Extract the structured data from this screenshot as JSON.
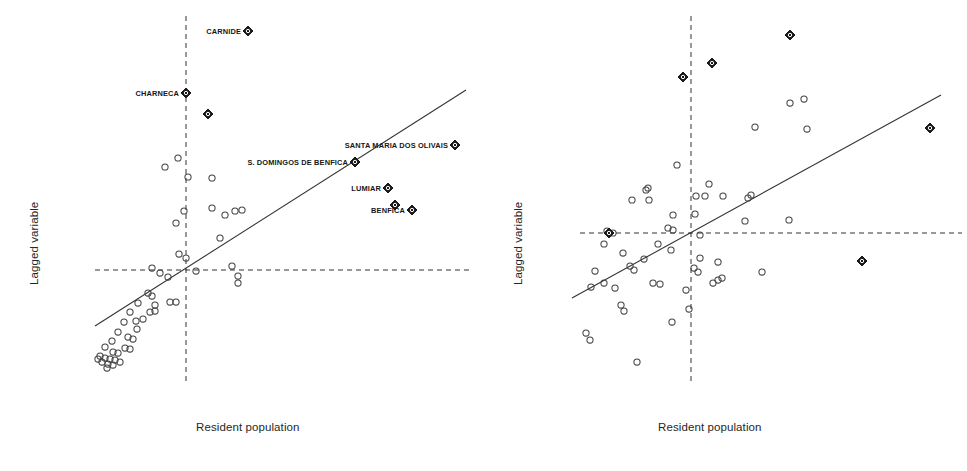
{
  "figure": {
    "background": "#ffffff",
    "ink": "#333333",
    "marker_open_color": "#444444",
    "marker_filled_color": "#1a1a1a"
  },
  "chart_data": [
    {
      "id": "left-panel",
      "type": "scatter",
      "title": "",
      "xlabel": "Resident population",
      "ylabel": "Lagged variable",
      "grid": false,
      "legend": null,
      "axis_mean_lines": {
        "vertical_x": 186,
        "horizontal_y": 270,
        "style": "dashed"
      },
      "fit_line": {
        "x1": 95,
        "y1": 326,
        "x2": 466,
        "y2": 90,
        "style": "solid"
      },
      "annotations": [
        {
          "label": "CARNIDE",
          "x": 248,
          "y": 31
        },
        {
          "label": "CHARNECA",
          "x": 186,
          "y": 93
        },
        {
          "label": "SANTA MARIA DOS OLIVAIS",
          "x": 455,
          "y": 145
        },
        {
          "label": "S. DOMINGOS DE BENFICA",
          "x": 355,
          "y": 162
        },
        {
          "label": "LUMIAR",
          "x": 388,
          "y": 188
        },
        {
          "label": "BENFICA",
          "x": 412,
          "y": 210
        }
      ],
      "highlight_points": [
        {
          "x": 248,
          "y": 31
        },
        {
          "x": 186,
          "y": 93
        },
        {
          "x": 208,
          "y": 114
        },
        {
          "x": 455,
          "y": 145
        },
        {
          "x": 355,
          "y": 162
        },
        {
          "x": 388,
          "y": 188
        },
        {
          "x": 412,
          "y": 210
        },
        {
          "x": 395,
          "y": 205
        }
      ],
      "points": [
        {
          "x": 178,
          "y": 158
        },
        {
          "x": 165,
          "y": 167
        },
        {
          "x": 188,
          "y": 177
        },
        {
          "x": 212,
          "y": 178
        },
        {
          "x": 212,
          "y": 208
        },
        {
          "x": 184,
          "y": 211
        },
        {
          "x": 235,
          "y": 211
        },
        {
          "x": 225,
          "y": 215
        },
        {
          "x": 242,
          "y": 210
        },
        {
          "x": 176,
          "y": 223
        },
        {
          "x": 220,
          "y": 238
        },
        {
          "x": 179,
          "y": 254
        },
        {
          "x": 186,
          "y": 258
        },
        {
          "x": 152,
          "y": 268
        },
        {
          "x": 232,
          "y": 266
        },
        {
          "x": 238,
          "y": 276
        },
        {
          "x": 238,
          "y": 283
        },
        {
          "x": 160,
          "y": 273
        },
        {
          "x": 168,
          "y": 277
        },
        {
          "x": 196,
          "y": 271
        },
        {
          "x": 148,
          "y": 293
        },
        {
          "x": 152,
          "y": 296
        },
        {
          "x": 138,
          "y": 303
        },
        {
          "x": 155,
          "y": 305
        },
        {
          "x": 170,
          "y": 302
        },
        {
          "x": 176,
          "y": 302
        },
        {
          "x": 150,
          "y": 312
        },
        {
          "x": 155,
          "y": 311
        },
        {
          "x": 130,
          "y": 312
        },
        {
          "x": 136,
          "y": 321
        },
        {
          "x": 143,
          "y": 319
        },
        {
          "x": 124,
          "y": 322
        },
        {
          "x": 137,
          "y": 329
        },
        {
          "x": 118,
          "y": 332
        },
        {
          "x": 128,
          "y": 337
        },
        {
          "x": 133,
          "y": 339
        },
        {
          "x": 112,
          "y": 341
        },
        {
          "x": 125,
          "y": 348
        },
        {
          "x": 130,
          "y": 349
        },
        {
          "x": 105,
          "y": 347
        },
        {
          "x": 113,
          "y": 352
        },
        {
          "x": 118,
          "y": 353
        },
        {
          "x": 100,
          "y": 356
        },
        {
          "x": 105,
          "y": 358
        },
        {
          "x": 110,
          "y": 359
        },
        {
          "x": 115,
          "y": 360
        },
        {
          "x": 102,
          "y": 362
        },
        {
          "x": 108,
          "y": 364
        },
        {
          "x": 113,
          "y": 365
        },
        {
          "x": 98,
          "y": 359
        },
        {
          "x": 120,
          "y": 362
        },
        {
          "x": 107,
          "y": 368
        }
      ]
    },
    {
      "id": "right-panel",
      "type": "scatter",
      "title": "",
      "xlabel": "Resident population",
      "ylabel": "Lagged variable",
      "grid": false,
      "legend": null,
      "axis_mean_lines": {
        "vertical_x": 691,
        "horizontal_y": 233,
        "style": "dashed"
      },
      "fit_line": {
        "x1": 572,
        "y1": 298,
        "x2": 941,
        "y2": 95,
        "style": "solid"
      },
      "annotations": [],
      "highlight_points": [
        {
          "x": 683,
          "y": 77
        },
        {
          "x": 712,
          "y": 63
        },
        {
          "x": 790,
          "y": 35
        },
        {
          "x": 930,
          "y": 128
        },
        {
          "x": 862,
          "y": 261
        },
        {
          "x": 609,
          "y": 233
        }
      ],
      "points": [
        {
          "x": 790,
          "y": 103
        },
        {
          "x": 804,
          "y": 99
        },
        {
          "x": 755,
          "y": 127
        },
        {
          "x": 807,
          "y": 129
        },
        {
          "x": 677,
          "y": 165
        },
        {
          "x": 646,
          "y": 190
        },
        {
          "x": 648,
          "y": 188
        },
        {
          "x": 632,
          "y": 200
        },
        {
          "x": 649,
          "y": 200
        },
        {
          "x": 709,
          "y": 184
        },
        {
          "x": 705,
          "y": 196
        },
        {
          "x": 696,
          "y": 196
        },
        {
          "x": 751,
          "y": 195
        },
        {
          "x": 723,
          "y": 196
        },
        {
          "x": 673,
          "y": 215
        },
        {
          "x": 695,
          "y": 214
        },
        {
          "x": 748,
          "y": 198
        },
        {
          "x": 745,
          "y": 221
        },
        {
          "x": 789,
          "y": 220
        },
        {
          "x": 668,
          "y": 228
        },
        {
          "x": 673,
          "y": 230
        },
        {
          "x": 700,
          "y": 235
        },
        {
          "x": 607,
          "y": 231
        },
        {
          "x": 613,
          "y": 233
        },
        {
          "x": 623,
          "y": 253
        },
        {
          "x": 671,
          "y": 250
        },
        {
          "x": 644,
          "y": 259
        },
        {
          "x": 630,
          "y": 266
        },
        {
          "x": 634,
          "y": 270
        },
        {
          "x": 700,
          "y": 258
        },
        {
          "x": 718,
          "y": 262
        },
        {
          "x": 694,
          "y": 268
        },
        {
          "x": 698,
          "y": 272
        },
        {
          "x": 595,
          "y": 271
        },
        {
          "x": 604,
          "y": 283
        },
        {
          "x": 591,
          "y": 287
        },
        {
          "x": 615,
          "y": 288
        },
        {
          "x": 653,
          "y": 283
        },
        {
          "x": 660,
          "y": 284
        },
        {
          "x": 686,
          "y": 290
        },
        {
          "x": 713,
          "y": 283
        },
        {
          "x": 718,
          "y": 280
        },
        {
          "x": 722,
          "y": 278
        },
        {
          "x": 762,
          "y": 272
        },
        {
          "x": 621,
          "y": 305
        },
        {
          "x": 624,
          "y": 311
        },
        {
          "x": 689,
          "y": 309
        },
        {
          "x": 672,
          "y": 322
        },
        {
          "x": 586,
          "y": 333
        },
        {
          "x": 590,
          "y": 340
        },
        {
          "x": 637,
          "y": 362
        },
        {
          "x": 604,
          "y": 244
        },
        {
          "x": 658,
          "y": 244
        }
      ]
    }
  ],
  "panels": {
    "left": {
      "y_axis_label": "Lagged variable",
      "x_axis_label": "Resident population"
    },
    "right": {
      "y_axis_label": "Lagged variable",
      "x_axis_label": "Resident population"
    }
  },
  "labels": {
    "carnide": "CARNIDE",
    "charneca": "CHARNECA",
    "santa_maria_dos_olivais": "SANTA MARIA DOS OLIVAIS",
    "s_domingos_de_benfica": "S. DOMINGOS DE BENFICA",
    "lumiar": "LUMIAR",
    "benfica": "BENFICA"
  }
}
